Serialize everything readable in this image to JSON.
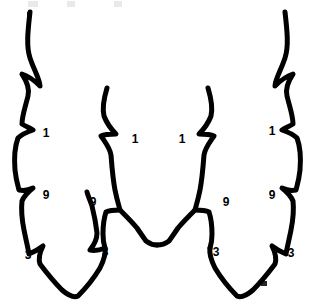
{
  "figure": {
    "background_color": "#ffffff",
    "stroke_color": "#000000",
    "stroke_width": 5,
    "width": 315,
    "height": 307,
    "symmetry": "mirror about vertical axis x=157.5"
  },
  "labels": [
    {
      "id": "outer-left-1",
      "text": "1",
      "x": 46,
      "y": 133
    },
    {
      "id": "outer-left-9",
      "text": "9",
      "x": 46,
      "y": 195
    },
    {
      "id": "outer-left-3",
      "text": "3",
      "x": 28,
      "y": 255
    },
    {
      "id": "inner-left-1",
      "text": "1",
      "x": 135,
      "y": 139
    },
    {
      "id": "inner-left-9",
      "text": "9",
      "x": 93,
      "y": 202
    },
    {
      "id": "inner-left-3",
      "text": "3",
      "x": 105,
      "y": 252
    },
    {
      "id": "inner-right-1",
      "text": "1",
      "x": 182,
      "y": 139
    },
    {
      "id": "inner-right-9",
      "text": "9",
      "x": 226,
      "y": 202
    },
    {
      "id": "inner-right-3",
      "text": "3",
      "x": 216,
      "y": 252
    },
    {
      "id": "outer-right-1",
      "text": "1",
      "x": 272,
      "y": 131
    },
    {
      "id": "outer-right-9",
      "text": "9",
      "x": 272,
      "y": 195
    },
    {
      "id": "outer-right-3",
      "text": "3",
      "x": 291,
      "y": 253
    }
  ],
  "paths": {
    "outer_left": "M 30 12 C 28 30 26 46 30 58 C 34 70 40 80 40 86 C 36 82 28 76 22 74 C 26 80 30 88 28 96 C 25 108 22 116 22 124 C 25 126 30 128 33 130 C 27 132 22 134 18 138 C 15 146 14 158 15 170 C 16 180 18 186 19 190 C 24 191 29 190 33 188 C 28 192 24 196 22 201 C 21 210 22 220 24 230 C 26 240 28 248 29 254 C 34 252 39 249 43 246 C 40 252 38 258 40 264 C 46 272 54 282 62 290 C 69 296 74 298 78 296 C 86 288 94 278 100 268 C 104 260 106 254 105 248 C 100 250 95 251 90 250 C 94 245 97 239 97 233 C 96 224 94 214 92 206 C 90 200 88 196 87 192",
    "inner_left": "M 107 88 C 104 98 102 108 104 116 C 107 124 112 130 116 134 C 111 134 105 134 101 136 C 105 142 110 148 111 155 C 112 168 113 180 115 190 C 117 200 119 206 120 210 C 115 210 110 210 106 212 C 104 218 103 226 103 234 C 103 240 104 245 105 248",
    "center_bottom_left": "M 120 210 C 126 216 132 222 137 228 C 141 234 144 238 146 241 C 150 244 154 245 157 245",
    "center_bottom_right": "M 157 245 C 161 245 165 244 169 241 C 171 238 174 234 178 228 C 183 222 189 216 195 210",
    "inner_right": "M 208 88 C 211 98 213 108 211 116 C 208 124 203 130 199 134 C 204 134 210 134 214 136 C 210 142 205 148 204 155 C 203 168 202 180 200 190 C 198 200 196 206 195 210 C 200 210 205 210 209 212 C 211 218 212 226 212 234 C 212 240 211 245 210 248",
    "outer_right": "M 285 12 C 287 30 289 46 285 58 C 281 70 275 80 275 86 C 279 82 287 76 293 74 C 289 80 285 88 287 96 C 290 108 293 116 293 124 C 290 126 285 128 282 130 C 288 132 293 134 297 138 C 300 146 301 158 300 170 C 299 180 297 186 296 190 C 291 191 286 190 282 188 C 287 192 291 196 293 201 C 294 210 293 220 291 230 C 289 240 287 248 286 254 C 281 252 276 249 272 246 C 275 252 277 258 275 264 C 269 272 261 282 253 290 C 246 296 241 298 237 296 C 229 288 221 278 215 268 C 211 260 209 254 210 248"
  },
  "edge_artifacts": [
    {
      "id": "top-left-mark",
      "x": 27,
      "y": 12,
      "width": 4,
      "height": 7,
      "faint": false
    },
    {
      "id": "top-faint-1",
      "x": 28,
      "y": 1,
      "width": 10,
      "height": 6,
      "faint": true
    },
    {
      "id": "top-faint-2",
      "x": 67,
      "y": 1,
      "width": 8,
      "height": 6,
      "faint": true
    },
    {
      "id": "top-faint-3",
      "x": 114,
      "y": 1,
      "width": 8,
      "height": 6,
      "faint": true
    },
    {
      "id": "bottom-right-mark",
      "x": 261,
      "y": 281,
      "width": 6,
      "height": 5,
      "faint": false
    }
  ]
}
